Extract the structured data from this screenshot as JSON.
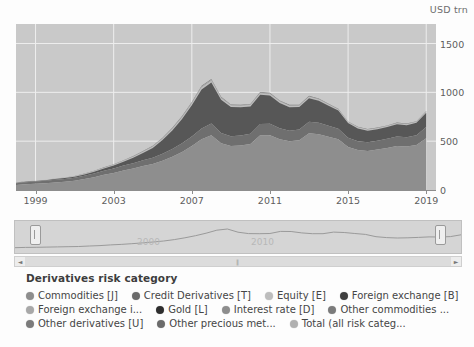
{
  "chart_data": {
    "type": "area",
    "stacked": true,
    "title": "",
    "xlabel": "",
    "ylabel": "USD trn",
    "unit_label": "USD trn",
    "xlim": [
      1998,
      2019.5
    ],
    "ylim": [
      0,
      1700
    ],
    "yticks": [
      0,
      500,
      1000,
      1500
    ],
    "ytick_labels": [
      "0",
      "500",
      "1000",
      "1500"
    ],
    "xticks": [
      1999,
      2003,
      2007,
      2011,
      2015,
      2019
    ],
    "xtick_labels": [
      "1999",
      "2003",
      "2007",
      "2011",
      "2015",
      "2019"
    ],
    "grid": true,
    "legend_position": "bottom",
    "x": [
      1998,
      1998.5,
      1999,
      1999.5,
      2000,
      2000.5,
      2001,
      2001.5,
      2002,
      2002.5,
      2003,
      2003.5,
      2004,
      2004.5,
      2005,
      2005.5,
      2006,
      2006.5,
      2007,
      2007.5,
      2008,
      2008.5,
      2009,
      2009.5,
      2010,
      2010.5,
      2011,
      2011.5,
      2012,
      2012.5,
      2013,
      2013.5,
      2014,
      2014.5,
      2015,
      2015.5,
      2016,
      2016.5,
      2017,
      2017.5,
      2018,
      2018.5,
      2019
    ],
    "series": [
      {
        "name": "Interest rate [D]",
        "color": "#8e8e8e",
        "values": [
          50,
          60,
          64,
          70,
          78,
          85,
          95,
          112,
          130,
          155,
          175,
          200,
          220,
          245,
          265,
          300,
          340,
          390,
          450,
          520,
          560,
          480,
          450,
          455,
          470,
          560,
          560,
          520,
          500,
          510,
          580,
          570,
          545,
          520,
          440,
          410,
          400,
          415,
          430,
          450,
          445,
          460,
          530
        ]
      },
      {
        "name": "Foreign exchange [B]",
        "color": "#6f6f6f",
        "values": [
          18,
          20,
          22,
          24,
          26,
          28,
          30,
          34,
          38,
          42,
          46,
          50,
          55,
          60,
          66,
          72,
          80,
          88,
          98,
          110,
          120,
          105,
          100,
          102,
          106,
          115,
          118,
          112,
          108,
          110,
          120,
          118,
          112,
          108,
          95,
          90,
          88,
          90,
          94,
          98,
          96,
          100,
          115
        ]
      },
      {
        "name": "Credit Derivatives [T]",
        "color": "#575757",
        "values": [
          4,
          5,
          6,
          7,
          8,
          9,
          11,
          14,
          18,
          24,
          30,
          40,
          55,
          75,
          100,
          140,
          190,
          250,
          320,
          400,
          420,
          340,
          300,
          290,
          280,
          300,
          290,
          260,
          240,
          230,
          240,
          225,
          205,
          185,
          150,
          130,
          120,
          118,
          120,
          125,
          122,
          128,
          145
        ]
      },
      {
        "name": "Equity [E]",
        "color": "#bdbdbd",
        "values": [
          2,
          2,
          2,
          3,
          3,
          3,
          4,
          4,
          5,
          5,
          6,
          7,
          8,
          9,
          10,
          11,
          12,
          13,
          14,
          16,
          16,
          13,
          12,
          12,
          12,
          13,
          13,
          12,
          11,
          11,
          12,
          12,
          11,
          10,
          9,
          9,
          8,
          8,
          9,
          9,
          9,
          9,
          10
        ]
      },
      {
        "name": "Commodities [J]",
        "color": "#a3a3a3",
        "values": [
          1,
          1,
          1,
          1,
          2,
          2,
          2,
          2,
          3,
          3,
          4,
          4,
          5,
          6,
          7,
          8,
          9,
          10,
          11,
          13,
          13,
          9,
          8,
          8,
          8,
          8,
          8,
          7,
          7,
          6,
          6,
          6,
          5,
          5,
          4,
          4,
          4,
          4,
          4,
          4,
          4,
          4,
          5
        ]
      },
      {
        "name": "Other derivatives [U]",
        "color": "#7c7c7c",
        "values": [
          1,
          1,
          1,
          1,
          1,
          2,
          2,
          2,
          2,
          3,
          3,
          3,
          4,
          4,
          5,
          5,
          6,
          7,
          8,
          9,
          9,
          7,
          6,
          6,
          6,
          7,
          7,
          6,
          6,
          6,
          6,
          6,
          5,
          5,
          4,
          4,
          4,
          4,
          4,
          4,
          4,
          4,
          5
        ]
      }
    ],
    "totals": [
      76,
      89,
      96,
      106,
      118,
      129,
      144,
      168,
      196,
      232,
      264,
      304,
      347,
      399,
      453,
      536,
      637,
      758,
      901,
      1068,
      1138,
      954,
      876,
      873,
      882,
      1003,
      996,
      917,
      872,
      873,
      964,
      937,
      883,
      833,
      702,
      647,
      624,
      639,
      661,
      690,
      680,
      705,
      810
    ],
    "navigator": {
      "year_labels": [
        "2000",
        "2010"
      ],
      "line_color": "#9a9a9a"
    }
  },
  "legend": {
    "title": "Derivatives risk category",
    "rows": [
      [
        {
          "label": "Commodities [J]",
          "color": "#8d8d8d"
        },
        {
          "label": "Credit Derivatives [T]",
          "color": "#6b6b6b"
        },
        {
          "label": "Equity [E]",
          "color": "#bdbdbd"
        },
        {
          "label": "Foreign exchange [B]",
          "color": "#3f3f3f"
        }
      ],
      [
        {
          "label": "Foreign exchange i...",
          "color": "#a8a8a8"
        },
        {
          "label": "Gold [L]",
          "color": "#2e2e2e"
        },
        {
          "label": "Interest rate [D]",
          "color": "#8d8d8d"
        },
        {
          "label": "Other commodities ...",
          "color": "#7b7b7b"
        }
      ],
      [
        {
          "label": "Other derivatives [U]",
          "color": "#7b7b7b"
        },
        {
          "label": "Other precious met...",
          "color": "#6b6b6b"
        },
        {
          "label": "Total (all risk categ...",
          "color": "#b0b0b0"
        }
      ]
    ]
  },
  "scrollbar": {
    "left_arrow": "◄",
    "right_arrow": "►",
    "grip": "‖"
  }
}
